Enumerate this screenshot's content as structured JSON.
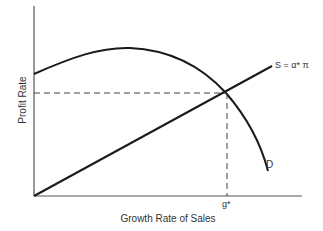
{
  "diagram": {
    "type": "economics-equilibrium",
    "axes": {
      "x_label": "Growth Rate of Sales",
      "y_label": "Profit Rate"
    },
    "curves": {
      "demand_label": "D",
      "supply_label": "S = α* π"
    },
    "equilibrium": {
      "x_tick_label": "g*"
    },
    "colors": {
      "curve": "#1a1a1a",
      "axis": "#555555",
      "text": "#333333"
    }
  }
}
